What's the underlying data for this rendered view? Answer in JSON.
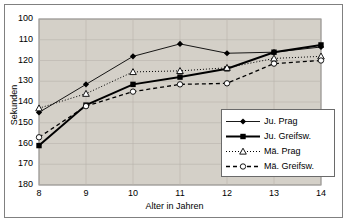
{
  "chart_data": {
    "type": "line",
    "title": "",
    "xlabel": "Alter in Jahren",
    "ylabel": "Sekunden",
    "x": [
      8,
      9,
      10,
      11,
      12,
      13,
      14
    ],
    "xticks": [
      "8",
      "9",
      "10",
      "11",
      "12",
      "13",
      "14"
    ],
    "yticks": [
      "100",
      "110",
      "120",
      "130",
      "140",
      "150",
      "160",
      "170",
      "180"
    ],
    "ylim": [
      100,
      180
    ],
    "y_inverted": true,
    "xlim": [
      8,
      14
    ],
    "grid": true,
    "legend_position": "inside-bottom-right",
    "plot_background": "#d4d0c8",
    "series": [
      {
        "name": "Ju. Prag",
        "values": [
          145,
          131.5,
          118,
          112,
          116.5,
          116,
          113.5
        ],
        "marker": "filled-diamond",
        "line": "solid-thin",
        "color": "#000000"
      },
      {
        "name": "Ju. Greifsw.",
        "values": [
          161,
          141.5,
          131.5,
          128,
          124,
          116,
          112.5
        ],
        "marker": "filled-square",
        "line": "solid-thick",
        "color": "#000000"
      },
      {
        "name": "Mä. Prag",
        "values": [
          143,
          136,
          125.5,
          125,
          123.5,
          119,
          118
        ],
        "marker": "open-triangle",
        "line": "dotted",
        "color": "#000000"
      },
      {
        "name": "Mä. Greifsw.",
        "values": [
          157,
          142,
          135,
          131.5,
          131,
          121.5,
          120
        ],
        "marker": "open-circle",
        "line": "dashed",
        "color": "#000000"
      }
    ]
  },
  "legend": {
    "items": [
      {
        "label": "Ju. Prag"
      },
      {
        "label": "Ju. Greifsw."
      },
      {
        "label": "Mä. Prag"
      },
      {
        "label": "Mä. Greifsw."
      }
    ]
  }
}
